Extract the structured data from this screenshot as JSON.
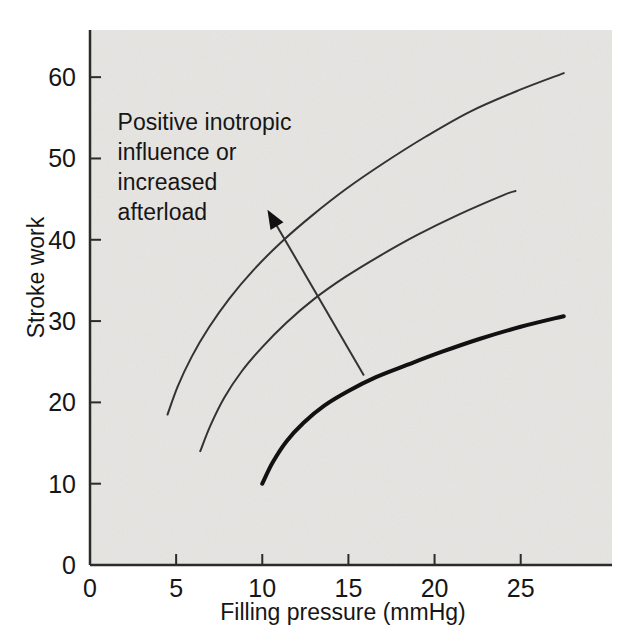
{
  "figure": {
    "background_color": "#ffffff",
    "plot_background_color": "#e6e5e2",
    "axis_color": "#2b2b2b",
    "curve_color": "#333333",
    "bold_curve_color": "#111111"
  },
  "chart_data": {
    "type": "line",
    "title": "",
    "subtitle": "",
    "xlabel": "Filling pressure (mmHg)",
    "ylabel": "Stroke work",
    "xlim": [
      0,
      30.3
    ],
    "ylim": [
      0,
      65.8
    ],
    "xticks": [
      0,
      5,
      10,
      15,
      20,
      25
    ],
    "xticklabels": [
      "0",
      "5",
      "10",
      "15",
      "20",
      "25"
    ],
    "yticks": [
      0,
      10,
      20,
      30,
      40,
      50,
      60
    ],
    "yticklabels": [
      "0",
      "10",
      "20",
      "30",
      "40",
      "50",
      "60"
    ],
    "grid": false,
    "legend": null,
    "series": [
      {
        "name": "normal-ventricular-function-curve",
        "style": "bold",
        "linewidth": 4,
        "x": [
          10.0,
          10.6,
          11.4,
          12.4,
          13.6,
          15.0,
          16.6,
          18.4,
          20.4,
          22.6,
          25.0,
          27.5
        ],
        "y": [
          10.0,
          12.6,
          15.2,
          17.5,
          19.6,
          21.4,
          23.1,
          24.6,
          26.2,
          27.8,
          29.3,
          30.6
        ]
      },
      {
        "name": "middle-function-curve",
        "style": "thin",
        "linewidth": 2,
        "x": [
          6.4,
          7.0,
          7.8,
          8.8,
          10.0,
          11.4,
          13.0,
          14.8,
          16.8,
          19.0,
          21.4,
          24.0,
          24.7
        ],
        "y": [
          14.0,
          17.2,
          20.6,
          23.8,
          26.8,
          29.8,
          32.7,
          35.4,
          38.0,
          40.6,
          43.1,
          45.5,
          46.0
        ]
      },
      {
        "name": "upper-function-curve",
        "style": "thin",
        "linewidth": 2,
        "x": [
          4.5,
          5.1,
          5.9,
          6.9,
          8.1,
          9.5,
          11.1,
          12.9,
          14.9,
          17.1,
          19.5,
          22.1,
          24.9,
          27.5
        ],
        "y": [
          18.5,
          22.0,
          25.6,
          29.2,
          32.8,
          36.3,
          39.7,
          43.0,
          46.3,
          49.5,
          52.7,
          55.8,
          58.4,
          60.5
        ]
      }
    ],
    "annotations": [
      {
        "name": "direction-annotation",
        "text_lines": [
          "Positive inotropic",
          "influence or",
          "increased",
          "afterload"
        ],
        "text_anchor_data": {
          "x": 1.6,
          "y": 53.5
        },
        "arrow": {
          "tail": {
            "x": 15.9,
            "y": 23.3
          },
          "head": {
            "x": 10.3,
            "y": 43.7
          },
          "head_style": "solid-triangle"
        }
      }
    ]
  }
}
